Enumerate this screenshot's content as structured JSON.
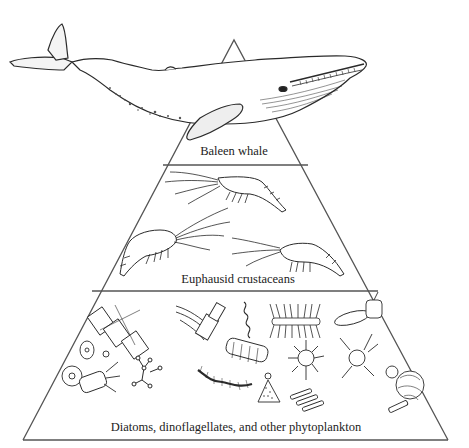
{
  "colors": {
    "line": "#555555",
    "ink": "#2a2a2a",
    "background": "#ffffff"
  },
  "pyramid": {
    "apex": [
      234,
      40
    ],
    "tiers": [
      {
        "level": 1,
        "label": "Baleen whale",
        "organism_icon": "whale-icon"
      },
      {
        "level": 2,
        "label": "Euphausid crustaceans",
        "organism_icon": "krill-icon"
      },
      {
        "level": 3,
        "label": "Diatoms, dinoflagellates, and other phytoplankton",
        "organism_icon": "phytoplankton-icon"
      }
    ]
  }
}
